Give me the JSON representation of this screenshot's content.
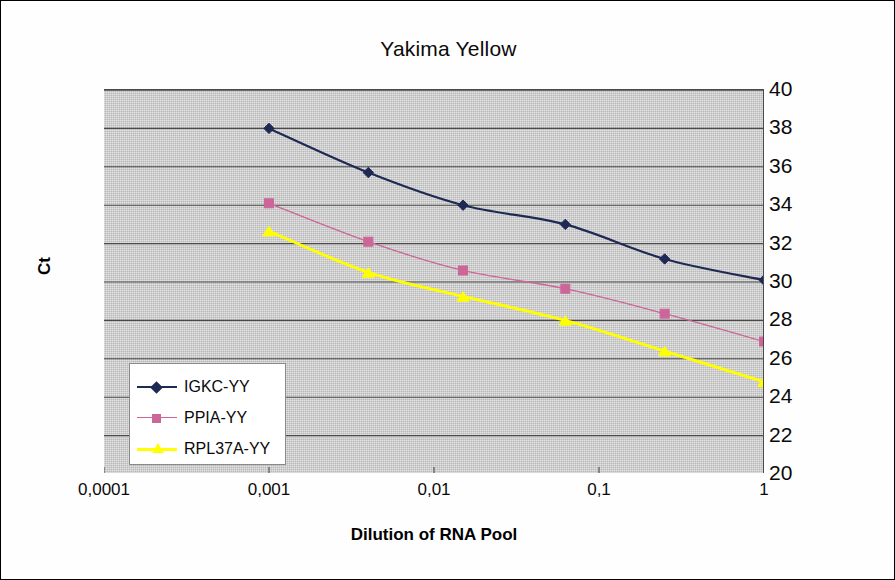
{
  "chart_data": {
    "type": "line",
    "title": "Yakima Yellow",
    "xlabel": "Dilution of RNA Pool",
    "ylabel": "Ct",
    "xscale": "log",
    "xlim": [
      0.0001,
      1
    ],
    "ylim": [
      20,
      40
    ],
    "ytick_labels": [
      "40",
      "38",
      "36",
      "34",
      "32",
      "30",
      "28",
      "26",
      "24",
      "22",
      "20"
    ],
    "ytick_values": [
      40,
      38,
      36,
      34,
      32,
      30,
      28,
      26,
      24,
      22,
      20
    ],
    "xtick_labels": [
      "0,0001",
      "0,001",
      "0,01",
      "0,1",
      "1"
    ],
    "xtick_values": [
      0.0001,
      0.001,
      0.01,
      0.1,
      1
    ],
    "grid": "horizontal",
    "legend_position": "inside-lower-left",
    "plot_background": "#c9c9c9",
    "x": [
      0.001,
      0.004,
      0.015,
      0.0625,
      0.25,
      1
    ],
    "series": [
      {
        "name": "IGKC-YY",
        "color": "#1f2a54",
        "marker": "diamond",
        "values": [
          38.0,
          35.7,
          34.0,
          33.0,
          31.2,
          30.1
        ]
      },
      {
        "name": "PPIA-YY",
        "color": "#cc6699",
        "marker": "square",
        "values": [
          34.1,
          32.1,
          30.6,
          29.65,
          28.35,
          26.9
        ]
      },
      {
        "name": "RPL37A-YY",
        "color": "#ffff00",
        "marker": "triangle",
        "values": [
          32.65,
          30.5,
          29.25,
          28.0,
          26.4,
          24.8
        ]
      }
    ]
  },
  "legend": {
    "items": [
      {
        "label": "IGKC-YY",
        "color": "#1f2a54",
        "marker": "diamond"
      },
      {
        "label": "PPIA-YY",
        "color": "#cc6699",
        "marker": "square"
      },
      {
        "label": "RPL37A-YY",
        "color": "#ffff00",
        "marker": "triangle"
      }
    ]
  }
}
